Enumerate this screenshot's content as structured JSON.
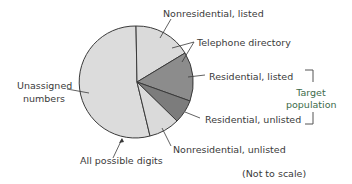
{
  "diagram": {
    "type": "pie-diagram",
    "segments": [
      {
        "id": "nonresidential-listed",
        "label": "Nonresidential, listed",
        "fill": "#d9d9d9"
      },
      {
        "id": "residential-listed",
        "label": "Residential, listed",
        "fill": "#8a8a8a"
      },
      {
        "id": "residential-unlisted",
        "label": "Residential, unlisted",
        "fill": "#7a7a7a"
      },
      {
        "id": "nonresidential-unlisted",
        "label": "Nonresidential, unlisted",
        "fill": "#d9d9d9"
      },
      {
        "id": "unassigned",
        "label": "Unassigned numbers",
        "fill": "#dcdcdc"
      }
    ],
    "labels": {
      "nonresidential_listed": "Nonresidential, listed",
      "telephone_directory": "Telephone directory",
      "residential_listed": "Residential, listed",
      "residential_unlisted": "Residential, unlisted",
      "nonresidential_unlisted": "Nonresidential, unlisted",
      "unassigned_line1": "Unassigned",
      "unassigned_line2": "numbers",
      "all_possible_digits": "All possible digits",
      "target_line1": "Target",
      "target_line2": "population",
      "note": "(Not to scale)"
    },
    "colors": {
      "light": "#dcdcdc",
      "dark": "#8a8a8a",
      "darker": "#767676",
      "outline": "#3a3a3a",
      "target_text": "#3d6b4a"
    }
  }
}
